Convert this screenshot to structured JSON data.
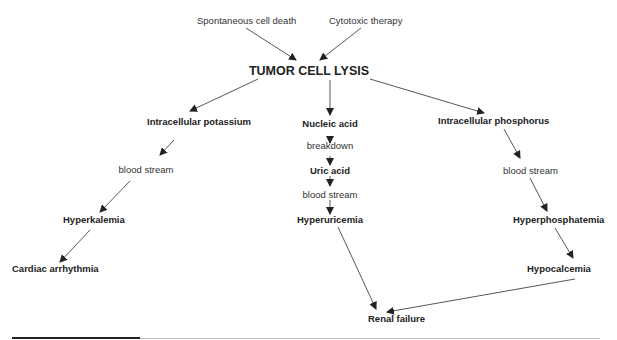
{
  "diagram": {
    "title": "TUMOR CELL LYSIS",
    "causes": [
      "Spontaneous cell death",
      "Cytotoxic therapy"
    ],
    "branches": {
      "left": {
        "source": "Intracellular potassium",
        "link": "blood stream",
        "result": "Hyperkalemia",
        "outcome": "Cardiac arrhythmia"
      },
      "center": {
        "source": "Nucleic acid",
        "link1": "breakdown",
        "intermediate": "Uric acid",
        "link2": "blood stream",
        "result": "Hyperuricemia"
      },
      "right": {
        "source": "Intracellular phosphorus",
        "link": "blood stream",
        "result": "Hyperphosphatemia",
        "outcome": "Hypocalcemia"
      }
    },
    "final": "Renal failure",
    "colors": {
      "text": "#222222",
      "arrow": "#333333"
    }
  }
}
